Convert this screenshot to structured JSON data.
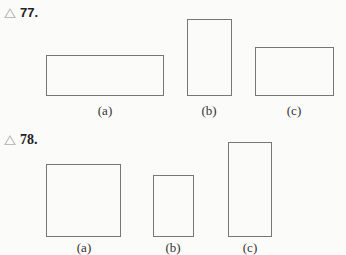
{
  "problems": [
    {
      "number": "77.",
      "icon": "triangle-icon",
      "figures": [
        {
          "label": "(a)",
          "shape": "rectangle",
          "orientation": "wide"
        },
        {
          "label": "(b)",
          "shape": "rectangle",
          "orientation": "tall"
        },
        {
          "label": "(c)",
          "shape": "rectangle",
          "orientation": "wide"
        }
      ]
    },
    {
      "number": "78.",
      "icon": "triangle-icon",
      "figures": [
        {
          "label": "(a)",
          "shape": "square"
        },
        {
          "label": "(b)",
          "shape": "rectangle",
          "orientation": "tall"
        },
        {
          "label": "(c)",
          "shape": "rectangle",
          "orientation": "tall"
        }
      ]
    }
  ]
}
